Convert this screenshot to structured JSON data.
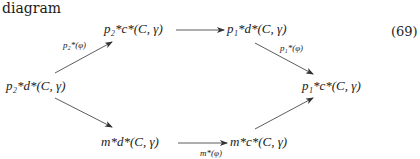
{
  "caption": "diagram",
  "equation_number": "(69)",
  "nodes": {
    "left": "p₂*d*(C, γ)",
    "top_left": "p₂*c*(C, γ)",
    "top_right": "p₁*d*(C, γ)",
    "right": "p₁*c*(C, γ)",
    "bottom_left": "m*d*(C, γ)",
    "bottom_right": "m*c*(C, γ)"
  },
  "arrows": {
    "left_to_top_left": "p₂*(φ)",
    "top_right_to_right": "p₁*(φ)",
    "bottom_left_to_bottom_right": "m*(φ)"
  }
}
